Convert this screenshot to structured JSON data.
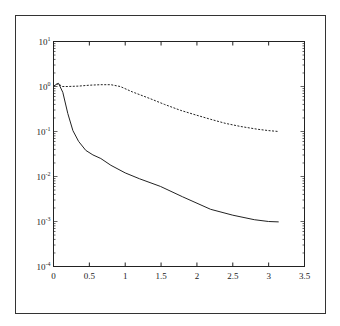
{
  "chart_data": {
    "type": "line",
    "title": "",
    "xlabel": "",
    "ylabel": "",
    "xlim": [
      0,
      3.5
    ],
    "ylim": [
      0.0001,
      10
    ],
    "yscale": "log",
    "grid": false,
    "legend": null,
    "x_ticks": [
      "0",
      "0.5",
      "1",
      "1.5",
      "2",
      "2.5",
      "3",
      "3.5"
    ],
    "y_ticks": [
      {
        "base": "10",
        "exp": "1",
        "value": 1
      },
      {
        "base": "10",
        "exp": "0",
        "value": 0
      },
      {
        "base": "10",
        "exp": "-1",
        "value": -1
      },
      {
        "base": "10",
        "exp": "-2",
        "value": -2
      },
      {
        "base": "10",
        "exp": "-3",
        "value": -3
      },
      {
        "base": "10",
        "exp": "-4",
        "value": -4
      }
    ],
    "series": [
      {
        "name": "solid",
        "style": "solid",
        "x": [
          0.0,
          0.04,
          0.07,
          0.13,
          0.2,
          0.27,
          0.35,
          0.45,
          0.55,
          0.66,
          0.8,
          1.0,
          1.2,
          1.49,
          1.8,
          2.19,
          2.5,
          2.8,
          3.0,
          3.14
        ],
        "log10_y": [
          0.0,
          0.05,
          0.07,
          -0.13,
          -0.6,
          -0.98,
          -1.22,
          -1.42,
          -1.52,
          -1.6,
          -1.75,
          -1.92,
          -2.05,
          -2.22,
          -2.45,
          -2.73,
          -2.86,
          -2.96,
          -3.0,
          -3.01
        ]
      },
      {
        "name": "dashed",
        "style": "dashed",
        "x": [
          0.0,
          0.04,
          0.07,
          0.12,
          0.2,
          0.35,
          0.5,
          0.66,
          0.8,
          0.93,
          1.1,
          1.35,
          1.55,
          1.77,
          2.0,
          2.19,
          2.4,
          2.61,
          2.85,
          3.0,
          3.14
        ],
        "log10_y": [
          0.0,
          0.05,
          0.06,
          0.0,
          0.0,
          0.01,
          0.03,
          0.04,
          0.04,
          0.0,
          -0.12,
          -0.27,
          -0.4,
          -0.53,
          -0.64,
          -0.73,
          -0.82,
          -0.89,
          -0.95,
          -0.98,
          -1.0
        ]
      }
    ]
  }
}
